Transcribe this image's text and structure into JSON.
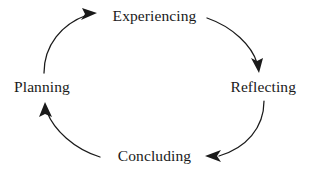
{
  "diagram": {
    "type": "cyclical-process",
    "direction": "clockwise",
    "stroke_color": "#1a1a1a",
    "background_color": "#ffffff",
    "nodes": [
      {
        "id": "experiencing",
        "label": "Experiencing",
        "position": "top"
      },
      {
        "id": "reflecting",
        "label": "Reflecting",
        "position": "right"
      },
      {
        "id": "concluding",
        "label": "Concluding",
        "position": "bottom"
      },
      {
        "id": "planning",
        "label": "Planning",
        "position": "left"
      }
    ],
    "arrows": [
      {
        "id": "planning-to-experiencing",
        "from": "Planning",
        "to": "Experiencing",
        "arrowhead": "right"
      },
      {
        "id": "experiencing-to-reflecting",
        "from": "Experiencing",
        "to": "Reflecting",
        "arrowhead": "down"
      },
      {
        "id": "reflecting-to-concluding",
        "from": "Reflecting",
        "to": "Concluding",
        "arrowhead": "left"
      },
      {
        "id": "concluding-to-planning",
        "from": "Concluding",
        "to": "Planning",
        "arrowhead": "up"
      }
    ]
  }
}
